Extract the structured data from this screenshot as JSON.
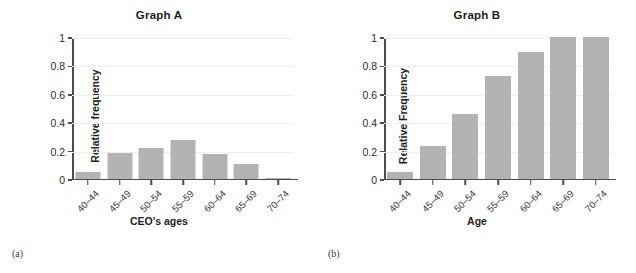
{
  "figure": {
    "panels": [
      {
        "caption": "(a)",
        "title": "Graph A",
        "ylabel": "Relative frequency",
        "xlabel": "CEO's ages"
      },
      {
        "caption": "(b)",
        "title": "Graph B",
        "ylabel": "Relative Frequency",
        "xlabel": "Age"
      }
    ]
  },
  "chart_data": [
    {
      "type": "bar",
      "title": "Graph A",
      "xlabel": "CEO's ages",
      "ylabel": "Relative frequency",
      "categories": [
        "40–44",
        "45–49",
        "50–54",
        "55–59",
        "60–64",
        "65–69",
        "70–74"
      ],
      "values": [
        0.05,
        0.18,
        0.22,
        0.275,
        0.175,
        0.105,
        0.005
      ],
      "ylim": [
        0,
        1
      ],
      "yticks": [
        0,
        0.2,
        0.4,
        0.6,
        0.8,
        1
      ],
      "yticklabels": [
        "0",
        "0.2",
        "0.4",
        "0.6",
        "0.8",
        "1"
      ],
      "grid": true,
      "legend": "none",
      "bar_color": "#b3b3b3",
      "tick_label_rotation": -45
    },
    {
      "type": "bar",
      "title": "Graph B",
      "xlabel": "Age",
      "ylabel": "Relative Frequency",
      "categories": [
        "40–44",
        "45–49",
        "50–54",
        "55–59",
        "60–64",
        "65–69",
        "70–74"
      ],
      "values": [
        0.05,
        0.235,
        0.455,
        0.725,
        0.895,
        1.0,
        1.0
      ],
      "ylim": [
        0,
        1
      ],
      "yticks": [
        0,
        0.2,
        0.4,
        0.6,
        0.8,
        1
      ],
      "yticklabels": [
        "0",
        "0.2",
        "0.4",
        "0.6",
        "0.8",
        "1"
      ],
      "grid": true,
      "legend": "none",
      "bar_color": "#b3b3b3",
      "tick_label_rotation": -45
    }
  ]
}
